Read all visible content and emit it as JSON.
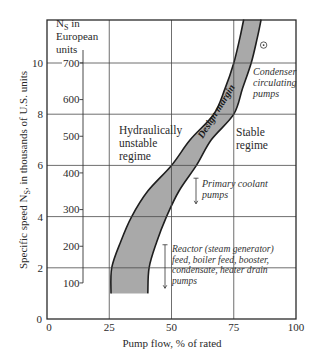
{
  "chart_data": {
    "type": "area",
    "title": "",
    "xlabel": "Pump flow, % of rated",
    "ylabel": {
      "main": "Specific speed N",
      "sub": "S",
      "rest": ", in thousands of U.S. units"
    },
    "xlim": [
      0,
      100
    ],
    "ylim": [
      0,
      11.7
    ],
    "x_ticks": [
      0,
      25,
      50,
      75,
      100
    ],
    "y_ticks": [
      0,
      2,
      4,
      6,
      8,
      10
    ],
    "grid": true,
    "secondary_y_axis": {
      "title": {
        "main": "N",
        "sub": "S",
        "rest": " in",
        "line2": "European",
        "line3": "units"
      },
      "ticks": [
        100,
        200,
        300,
        400,
        500,
        600,
        700
      ]
    },
    "series": [
      {
        "name": "Design margin",
        "kind": "band",
        "left_edge": [
          [
            25.7,
            1.0
          ],
          [
            26,
            2
          ],
          [
            29.5,
            3
          ],
          [
            34,
            4
          ],
          [
            40.5,
            5
          ],
          [
            50,
            6
          ],
          [
            57.5,
            7
          ],
          [
            67,
            8
          ],
          [
            71.5,
            9
          ],
          [
            75,
            10
          ],
          [
            77.5,
            11
          ],
          [
            79,
            11.7
          ]
        ],
        "right_edge": [
          [
            40.5,
            1.0
          ],
          [
            41,
            2
          ],
          [
            44,
            3
          ],
          [
            48,
            4
          ],
          [
            53,
            5
          ],
          [
            60,
            6
          ],
          [
            66,
            7
          ],
          [
            75,
            8
          ],
          [
            78.5,
            9
          ],
          [
            82,
            10
          ],
          [
            84.5,
            11
          ],
          [
            86,
            11.7
          ]
        ],
        "fill": "#a9a9a9",
        "stroke": "#1e1e1e"
      }
    ],
    "band_label": "Design margin",
    "marker": {
      "symbol": "circled-dot",
      "x": 87,
      "y": 10.7
    },
    "regions": [
      {
        "name": "Hydraulically unstable regime",
        "lines": [
          "Hydraulically",
          "unstable",
          "regime"
        ]
      },
      {
        "name": "Stable regime",
        "lines": [
          "Stable",
          "regime"
        ]
      }
    ],
    "annotations": [
      {
        "name": "Condenser circulating pumps",
        "lines": [
          "Condenser",
          "circulating",
          "pumps"
        ]
      },
      {
        "name": "Primary coolant pumps",
        "lines": [
          "Primary coolant",
          "pumps"
        ],
        "ns_range": [
          4.5,
          5.5
        ]
      },
      {
        "name": "Reactor feed pumps",
        "lines": [
          "Reactor (steam generator)",
          "feed, boiler feed, booster,",
          "condensate, heater drain",
          "pumps"
        ],
        "ns_range": [
          1.2,
          2.9
        ]
      }
    ]
  }
}
